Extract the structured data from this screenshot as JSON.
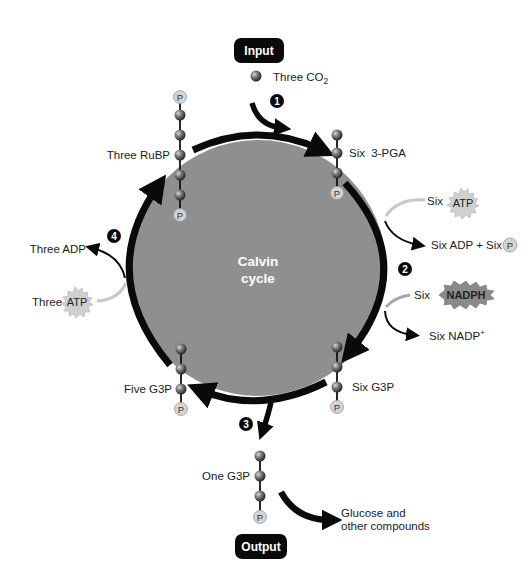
{
  "title": "Calvin cycle",
  "center_label": {
    "line1": "Calvin",
    "line2": "cycle"
  },
  "input_badge": "Input",
  "output_badge": "Output",
  "steps": [
    "1",
    "2",
    "3",
    "4"
  ],
  "molecules": {
    "co2": {
      "prefix": "Three CO",
      "subscript": "2"
    },
    "rubp": "Three RuBP",
    "pga": "Six  3-PGA",
    "six_g3p": "Six G3P",
    "five_g3p": "Five G3P",
    "one_g3p": "One G3P",
    "phosphate": "P"
  },
  "energy": {
    "six_atp_prefix": "Six",
    "atp": "ATP",
    "six_adp": "Six ADP + Six",
    "six_nadph_prefix": "Six",
    "nadph": "NADPH",
    "six_nadp": "Six NADP",
    "nadp_sup": "+",
    "three_adp": "Three ADP",
    "three_atp_prefix": "Three"
  },
  "products": {
    "line1": "Glucose and",
    "line2": "other compounds"
  },
  "colors": {
    "circle_fill": "#8f8f8f",
    "arrow": "#0a0a0a",
    "input_arrow": "#c8c8c8",
    "bead": "#6a6a6a",
    "phosphate_fill": "#d4d4d4",
    "badge": "#0a0a0a",
    "atp_burst": "#d0d0d0",
    "nadph_burst": "#8a8a8a"
  }
}
